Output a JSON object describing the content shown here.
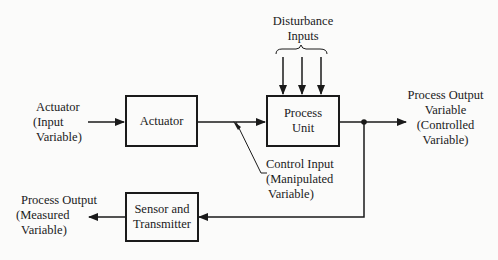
{
  "diagram": {
    "type": "block-diagram",
    "blocks": {
      "actuator": "Actuator",
      "process_unit_line1": "Process",
      "process_unit_line2": "Unit",
      "sensor_line1": "Sensor and",
      "sensor_line2": "Transmitter"
    },
    "labels": {
      "actuator_input": [
        "Actuator",
        "(Input",
        "Variable)"
      ],
      "disturbance": [
        "Disturbance",
        "Inputs"
      ],
      "process_output": [
        "Process Output",
        "Variable",
        "(Controlled",
        "Variable)"
      ],
      "control_input": [
        "Control Input",
        "(Manipulated",
        "Variable)"
      ],
      "measured_output": [
        "Process Output",
        "(Measured",
        "Variable)"
      ]
    },
    "colors": {
      "line": "#1a1a1a",
      "background": "#fbfbfa"
    }
  }
}
